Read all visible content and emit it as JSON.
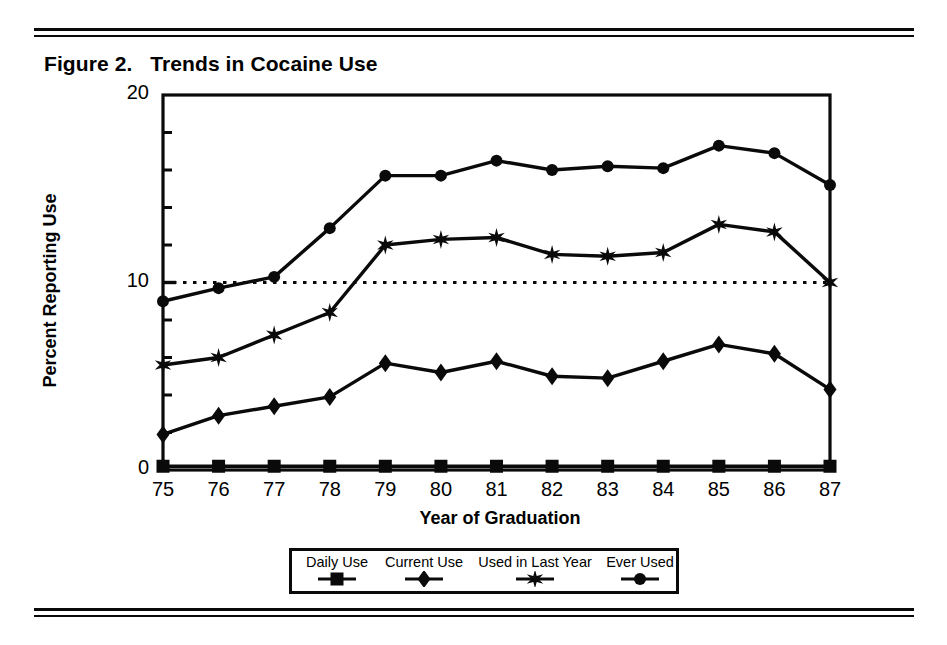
{
  "figure": {
    "title": "Figure 2.   Trends in Cocaine Use",
    "rule_color": "#0a0a0a"
  },
  "chart_data": {
    "type": "line",
    "title": "Figure 2.   Trends in Cocaine Use",
    "xlabel": "Year of Graduation",
    "ylabel": "Percent Reporting Use",
    "xlim": [
      75,
      87
    ],
    "ylim": [
      0,
      20
    ],
    "ytick_major": [
      0,
      10,
      20
    ],
    "ytick_minor": [
      2,
      4,
      6,
      8,
      12,
      14,
      16,
      18
    ],
    "ytick_labels": [
      "0",
      "10",
      "20"
    ],
    "grid": false,
    "reference_line": {
      "value": 10,
      "style": "dotted"
    },
    "legend_position": "bottom-outside",
    "categories": [
      "75",
      "76",
      "77",
      "78",
      "79",
      "80",
      "81",
      "82",
      "83",
      "84",
      "85",
      "86",
      "87"
    ],
    "x": [
      75,
      76,
      77,
      78,
      79,
      80,
      81,
      82,
      83,
      84,
      85,
      86,
      87
    ],
    "series": [
      {
        "name": "Ever Used",
        "marker": "circle",
        "values": [
          9.0,
          9.7,
          10.3,
          12.9,
          15.7,
          15.7,
          16.5,
          16.0,
          16.2,
          16.1,
          17.3,
          16.9,
          15.2
        ]
      },
      {
        "name": "Used in Last Year",
        "marker": "star",
        "values": [
          5.6,
          6.0,
          7.2,
          8.4,
          12.0,
          12.3,
          12.4,
          11.5,
          11.4,
          11.6,
          13.1,
          12.7,
          10.0
        ]
      },
      {
        "name": "Current Use",
        "marker": "diamond",
        "values": [
          1.9,
          2.9,
          3.4,
          3.9,
          5.7,
          5.2,
          5.8,
          5.0,
          4.9,
          5.8,
          6.7,
          6.2,
          4.3
        ]
      },
      {
        "name": "Daily Use",
        "marker": "square",
        "values": [
          0.2,
          0.2,
          0.2,
          0.2,
          0.2,
          0.2,
          0.2,
          0.2,
          0.2,
          0.2,
          0.2,
          0.2,
          0.2
        ]
      }
    ]
  },
  "legend": {
    "entries": [
      {
        "label": "Daily Use",
        "marker": "square"
      },
      {
        "label": "Current Use",
        "marker": "diamond"
      },
      {
        "label": "Used in Last Year",
        "marker": "star"
      },
      {
        "label": "Ever Used",
        "marker": "circle"
      }
    ]
  }
}
